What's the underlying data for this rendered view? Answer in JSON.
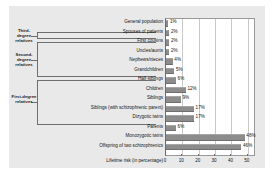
{
  "chart_data": {
    "type": "bar",
    "orientation": "horizontal",
    "title": "",
    "xlabel": "Lifetime risk (in percentage)",
    "ylabel": "",
    "xlim": [
      0,
      55
    ],
    "xticks": [
      0,
      10,
      20,
      30,
      40,
      50
    ],
    "grid": true,
    "legend": "none",
    "bar_color": "#8c8c8c",
    "plot_background": "#ffffff",
    "figure_background": "#e9e9e9",
    "categories": [
      "General population",
      "Spouses of patients",
      "First cousins",
      "Uncles/aunts",
      "Nephews/nieces",
      "Grandchildren",
      "Half-siblings",
      "Children",
      "Siblings",
      "Siblings (with schizophrenic parent)",
      "Dizygotic twins",
      "Parents",
      "Monozygotic twins",
      "Offspring of two schizophrenics"
    ],
    "values": [
      1,
      2,
      2,
      2,
      4,
      5,
      6,
      12,
      9,
      17,
      17,
      6,
      48,
      46
    ],
    "value_labels": [
      "1%",
      "2%",
      "2%",
      "2%",
      "4%",
      "5%",
      "6%",
      "12%",
      "9%",
      "17%",
      "17%",
      "6%",
      "48%",
      "46%"
    ]
  },
  "groups": [
    {
      "label": "Third-degree relatives",
      "rows": [
        2,
        2
      ]
    },
    {
      "label": "Second-degree relatives",
      "rows": [
        3,
        6
      ]
    },
    {
      "label": "First-degree relatives",
      "rows": [
        7,
        11
      ]
    }
  ]
}
